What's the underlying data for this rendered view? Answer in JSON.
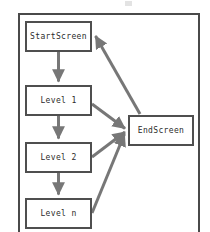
{
  "figure": {
    "type": "flowchart",
    "background_color": "#ffffff",
    "frame": {
      "name": "diagram-frame",
      "border_color": "#4a4a4a"
    },
    "node_style": {
      "fill": "#ffffff",
      "border_color": "#4f4f4f",
      "text_color": "#2b2b2b"
    },
    "edge_style": {
      "color": "#777777",
      "width": 3
    }
  },
  "nodes": [
    {
      "id": "start",
      "label": "StartScreen",
      "x": 25,
      "y": 21,
      "w": 67,
      "h": 31
    },
    {
      "id": "level1",
      "label": "Level 1",
      "x": 25,
      "y": 85,
      "w": 67,
      "h": 31
    },
    {
      "id": "level2",
      "label": "Level 2",
      "x": 25,
      "y": 142,
      "w": 67,
      "h": 31
    },
    {
      "id": "leveln",
      "label": "Level n",
      "x": 25,
      "y": 198,
      "w": 67,
      "h": 31
    },
    {
      "id": "end",
      "label": "EndScreen",
      "x": 128,
      "y": 115,
      "w": 66,
      "h": 31
    }
  ],
  "edges": [
    {
      "id": "start-to-level1",
      "from": "start",
      "to": "level1",
      "kind": "vertical"
    },
    {
      "id": "level1-to-level2",
      "from": "level1",
      "to": "level2",
      "kind": "vertical"
    },
    {
      "id": "level2-to-leveln",
      "from": "level2",
      "to": "leveln",
      "kind": "vertical"
    },
    {
      "id": "level1-to-end",
      "from": "level1",
      "to": "end",
      "kind": "diagonal"
    },
    {
      "id": "level2-to-end",
      "from": "level2",
      "to": "end",
      "kind": "diagonal"
    },
    {
      "id": "leveln-to-end",
      "from": "leveln",
      "to": "end",
      "kind": "diagonal"
    },
    {
      "id": "end-to-start",
      "from": "end",
      "to": "start",
      "kind": "diagonal"
    }
  ]
}
